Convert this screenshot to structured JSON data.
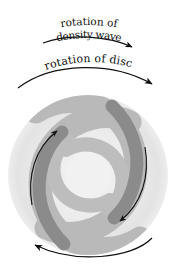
{
  "figure": {
    "background_color": "#ffffff"
  },
  "labels": {
    "density_wave_line1": "rotation of",
    "density_wave_line2": "density wave",
    "disc_rotation": "rotation of disc"
  },
  "arrows": {
    "density_wave_arc": "arc-arrow-right",
    "disc_rotation_arc": "arc-arrow-right",
    "bottom_disc_arc": "arc-arrow-left",
    "inner_upper_left": "arc-arrow-up",
    "inner_lower_right": "arc-arrow-down"
  },
  "colors": {
    "disc_outer": "#e4e4e4",
    "disc_inner": "#f0f0f0",
    "arm_light": "#b8b8b8",
    "arm_dark": "#8a8a8a",
    "ink": "#111111"
  },
  "disc": {
    "center_x": 88,
    "center_y": 175,
    "radius": 80
  }
}
